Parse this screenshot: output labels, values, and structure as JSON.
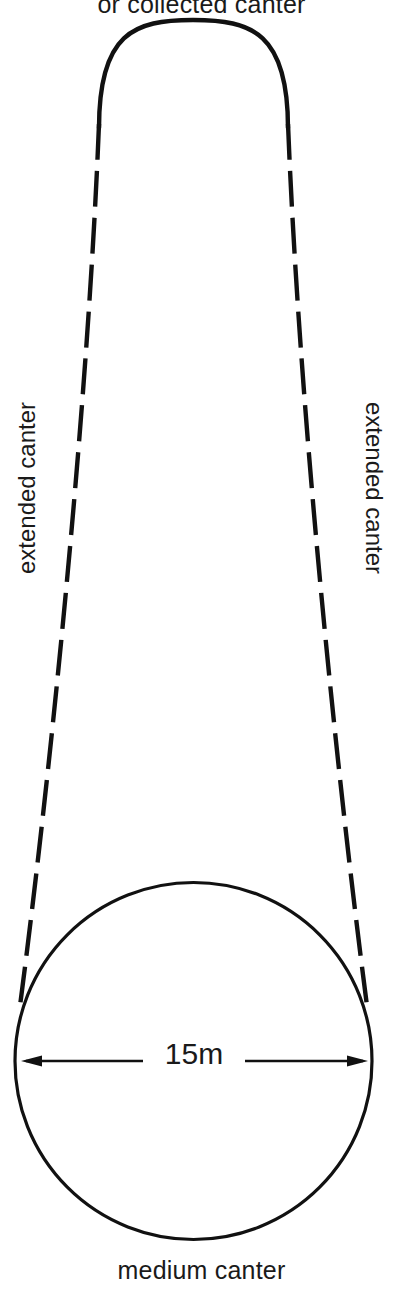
{
  "diagram": {
    "title_top": "or collected canter",
    "label_bottom": "medium canter",
    "label_left": "extended canter",
    "label_right": "extended canter",
    "dimension_label": "15m",
    "colors": {
      "background": "#ffffff",
      "stroke": "#111111",
      "text": "#1a1a1a"
    },
    "geometry": {
      "circle_center_x": 193.5,
      "circle_center_y": 1061,
      "circle_radius": 178.5,
      "top_arc_apex_x": 193,
      "top_arc_apex_y": 37,
      "dimension_line_y": 1061,
      "dimension_left_x": 22,
      "dimension_right_x": 367
    }
  }
}
